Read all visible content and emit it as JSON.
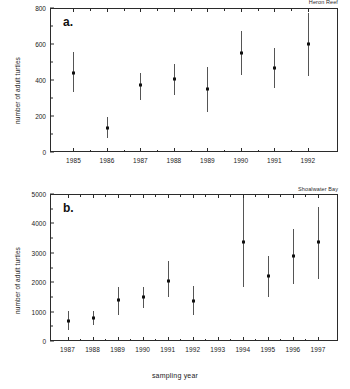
{
  "figure": {
    "xlabel": "sampling year",
    "ylabel": "number of adult turtles"
  },
  "panels": [
    {
      "letter": "a.",
      "site": "Heron Reef",
      "ylabel": "number of adult turtles"
    },
    {
      "letter": "b.",
      "site": "Shoalwater Bay",
      "ylabel": "number of adult turtles"
    }
  ],
  "chart_data": [
    {
      "type": "scatter",
      "title": "Heron Reef",
      "panel": "a.",
      "xlabel": "sampling year",
      "ylabel": "number of adult turtles",
      "xlim": [
        1984.3,
        1992.9
      ],
      "ylim": [
        0,
        800
      ],
      "yticks": [
        0,
        200,
        400,
        600,
        800
      ],
      "grid": false,
      "legend": "none",
      "errorbars": true,
      "categories": [
        1985,
        1986,
        1987,
        1988,
        1989,
        1990,
        1991,
        1992
      ],
      "tick_labels": [
        "1985",
        "1986",
        "1987",
        "1988",
        "1989",
        "1990",
        "1991",
        "1992"
      ],
      "values": [
        440,
        135,
        370,
        405,
        350,
        550,
        465,
        600
      ],
      "err_low": [
        335,
        80,
        290,
        315,
        220,
        425,
        355,
        420
      ],
      "err_high": [
        555,
        195,
        440,
        490,
        470,
        670,
        580,
        775
      ]
    },
    {
      "type": "scatter",
      "title": "Shoalwater Bay",
      "panel": "b.",
      "xlabel": "sampling year",
      "ylabel": "number of adult turtles",
      "xlim": [
        1986.3,
        1997.8
      ],
      "ylim": [
        0,
        5000
      ],
      "yticks": [
        0,
        1000,
        2000,
        3000,
        4000,
        5000
      ],
      "grid": false,
      "legend": "none",
      "errorbars": true,
      "categories": [
        1987,
        1988,
        1989,
        1990,
        1991,
        1992,
        1994,
        1995,
        1996,
        1997
      ],
      "tick_labels": [
        "1987",
        "1988",
        "1989",
        "1990",
        "1991",
        "1992",
        "1993",
        "1994",
        "1995",
        "1996",
        "1997"
      ],
      "values": [
        680,
        780,
        1400,
        1480,
        2050,
        1350,
        3380,
        2200,
        2900,
        3380
      ],
      "err_low": [
        380,
        560,
        900,
        1120,
        1480,
        900,
        1820,
        1500,
        1950,
        2100
      ],
      "err_high": [
        1020,
        1020,
        1820,
        1820,
        2720,
        1880,
        4850,
        2900,
        3800,
        4550
      ]
    }
  ]
}
